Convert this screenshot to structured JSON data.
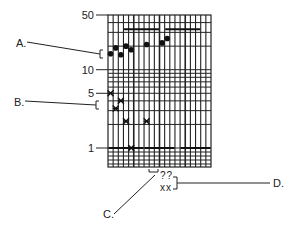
{
  "annotations": {
    "a": "A.",
    "b": "B.",
    "c": "C.",
    "d": "D."
  },
  "bottom_labels": {
    "top": "??",
    "bottom": "xx"
  },
  "y_ticks": [
    {
      "label": "50",
      "value": 50
    },
    {
      "label": "10",
      "value": 10
    },
    {
      "label": "5",
      "value": 5
    },
    {
      "label": "1",
      "value": 1
    }
  ],
  "chart_data": {
    "type": "scatter",
    "title": "",
    "xlabel": "",
    "ylabel": "",
    "y_scale": "log",
    "ylim": [
      0.7,
      50
    ],
    "grid": true,
    "y_tick_labels": [
      "50",
      "10",
      "5",
      "1"
    ],
    "series": [
      {
        "name": "A (dots)",
        "marker": "circle",
        "points": [
          {
            "x": 1,
            "y": 16
          },
          {
            "x": 2,
            "y": 19
          },
          {
            "x": 3,
            "y": 15.5
          },
          {
            "x": 4,
            "y": 20
          },
          {
            "x": 5,
            "y": 18
          },
          {
            "x": 8,
            "y": 21
          },
          {
            "x": 11,
            "y": 22
          },
          {
            "x": 12,
            "y": 25
          }
        ]
      },
      {
        "name": "B (asterisks)",
        "marker": "asterisk",
        "points": [
          {
            "x": 1,
            "y": 5
          },
          {
            "x": 3,
            "y": 4
          },
          {
            "x": 2,
            "y": 3.2
          },
          {
            "x": 4,
            "y": 2.2
          },
          {
            "x": 8,
            "y": 2.2
          },
          {
            "x": 5,
            "y": 1
          }
        ]
      }
    ],
    "reference_bars": [
      {
        "y": 33,
        "x_range": [
          4,
          10
        ]
      },
      {
        "y": 33,
        "x_range": [
          12,
          18
        ]
      },
      {
        "y": 1,
        "x_range": [
          1,
          7
        ]
      },
      {
        "y": 1,
        "x_range": [
          8,
          13
        ]
      },
      {
        "y": 1,
        "x_range": [
          15,
          20
        ]
      }
    ],
    "annotations": [
      {
        "label": "A.",
        "target": "dot group between 10 and 50"
      },
      {
        "label": "B.",
        "target": "asterisk group between 1 and 5"
      },
      {
        "label": "C.",
        "target": "x-axis interval bracket"
      },
      {
        "label": "D.",
        "target": "x-axis labels ?? / xx"
      }
    ]
  }
}
